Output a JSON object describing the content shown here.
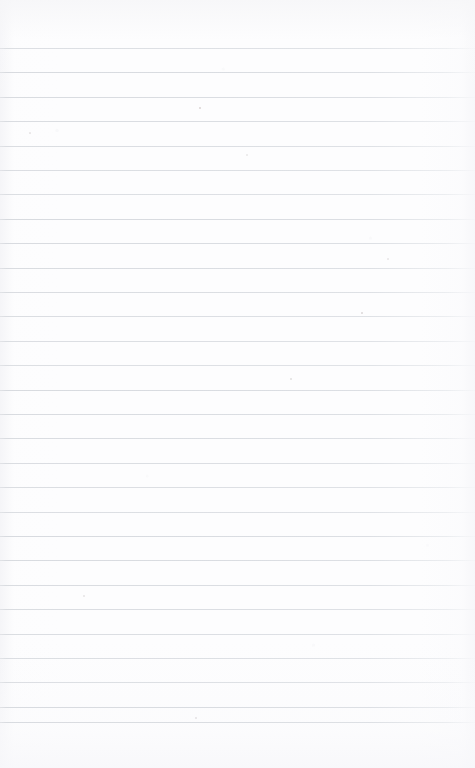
{
  "document": {
    "type": "scanned-ruled-notebook-page",
    "title": "Blank ruled notebook page",
    "orientation": "portrait",
    "width": 475,
    "height": 768,
    "text_content": "",
    "has_handwriting": false,
    "has_printed_text": false
  },
  "paper": {
    "background_color": "#fdfdfe",
    "edge_tint_color": "#f6f6f8",
    "top_margin_px": 48,
    "bottom_margin_px": 46
  },
  "ruling": {
    "style": "horizontal-ruled",
    "line_color": "#d8dbe0",
    "line_thickness_px": 1,
    "line_spacing_px": 24.4,
    "first_line_y": 48,
    "last_line_y": 722,
    "line_count": 29,
    "left_inset_px": 0,
    "right_inset_px": 0,
    "margin_rule": "none",
    "line_y_positions": [
      48,
      72.4,
      96.8,
      121.2,
      145.6,
      170,
      194.4,
      218.8,
      243.2,
      267.6,
      292,
      316.4,
      340.8,
      365.2,
      389.6,
      414,
      438.4,
      462.8,
      487.2,
      511.6,
      536,
      560.4,
      584.8,
      609.2,
      633.6,
      658,
      682.4,
      706.8,
      722
    ]
  },
  "artifacts": {
    "label": "scan specks and dust",
    "specks": [
      {
        "x": 200,
        "y": 108,
        "size": 1.6,
        "color": "rgba(196,186,186,0.55)"
      },
      {
        "x": 362,
        "y": 313,
        "size": 1.8,
        "color": "rgba(190,182,184,0.5)"
      },
      {
        "x": 291,
        "y": 379,
        "size": 1.5,
        "color": "rgba(198,192,194,0.45)"
      },
      {
        "x": 30,
        "y": 133,
        "size": 1.2,
        "color": "rgba(205,200,202,0.4)"
      },
      {
        "x": 84,
        "y": 596,
        "size": 1.3,
        "color": "rgba(203,198,200,0.4)"
      },
      {
        "x": 196,
        "y": 718,
        "size": 1.4,
        "color": "rgba(200,195,198,0.42)"
      },
      {
        "x": 247,
        "y": 155,
        "size": 1.1,
        "color": "rgba(206,202,204,0.35)"
      },
      {
        "x": 388,
        "y": 259,
        "size": 1.2,
        "color": "rgba(204,199,201,0.35)"
      }
    ]
  }
}
